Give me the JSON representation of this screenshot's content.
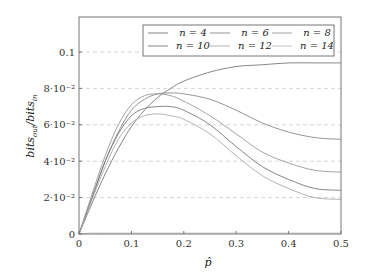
{
  "chart_data": {
    "type": "line",
    "title": "",
    "xlabel": "p̂",
    "ylabel": "bits_out / bits_in",
    "xlim": [
      0,
      0.5
    ],
    "ylim": [
      0,
      0.119
    ],
    "x_ticks": [
      "0",
      "0.1",
      "0.2",
      "0.3",
      "0.4",
      "0.5"
    ],
    "y_ticks": [
      "0",
      "2·10⁻²",
      "4·10⁻²",
      "6·10⁻²",
      "8·10⁻²",
      "0.1"
    ],
    "grid": "dashed horizontal",
    "legend_position": "upper right (2 rows x 3 cols)",
    "x": [
      0,
      0.025,
      0.05,
      0.075,
      0.1,
      0.125,
      0.15,
      0.175,
      0.2,
      0.25,
      0.3,
      0.35,
      0.4,
      0.45,
      0.5
    ],
    "series": [
      {
        "name": "n = 4",
        "color": "#777777",
        "values": [
          0,
          0.017,
          0.033,
          0.047,
          0.059,
          0.068,
          0.075,
          0.08,
          0.084,
          0.089,
          0.092,
          0.093,
          0.094,
          0.094,
          0.094
        ]
      },
      {
        "name": "n = 6",
        "color": "#888888",
        "values": [
          0,
          0.02,
          0.04,
          0.056,
          0.068,
          0.074,
          0.077,
          0.0775,
          0.077,
          0.074,
          0.068,
          0.061,
          0.056,
          0.053,
          0.052
        ]
      },
      {
        "name": "n = 8",
        "color": "#999999",
        "values": [
          0,
          0.022,
          0.043,
          0.06,
          0.071,
          0.076,
          0.077,
          0.076,
          0.073,
          0.065,
          0.055,
          0.045,
          0.039,
          0.035,
          0.034
        ]
      },
      {
        "name": "n = 10",
        "color": "#777777",
        "values": [
          0,
          0.02,
          0.04,
          0.055,
          0.065,
          0.069,
          0.07,
          0.07,
          0.068,
          0.06,
          0.048,
          0.037,
          0.03,
          0.025,
          0.024
        ]
      },
      {
        "name": "n = 12",
        "color": "#aaaaaa",
        "values": [
          0,
          0.019,
          0.037,
          0.052,
          0.061,
          0.065,
          0.066,
          0.065,
          0.063,
          0.055,
          0.043,
          0.032,
          0.025,
          0.02,
          0.019
        ]
      },
      {
        "name": "n = 14",
        "color": "#bbbbbb",
        "values": [
          0,
          0.0005,
          0.0005,
          0.0005,
          0.0005,
          0.0005,
          0.0005,
          0.0005,
          0.0005,
          0.0005,
          0.0005,
          0.0005,
          0.0005,
          0.0005,
          0.0005
        ]
      }
    ]
  },
  "legend": {
    "items": [
      "n = 4",
      "n = 6",
      "n = 8",
      "n = 10",
      "n = 12",
      "n = 14"
    ]
  },
  "axes": {
    "xlabel": "p̂",
    "ylabel_main": "bits",
    "ylabel_out_sub": "out",
    "ylabel_in_sub": "in"
  }
}
